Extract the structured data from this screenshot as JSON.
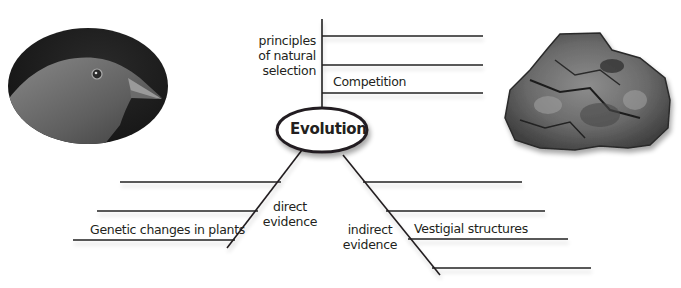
{
  "diagram": {
    "type": "concept-map",
    "center": {
      "label": "Evolution"
    },
    "branches": [
      {
        "id": "top",
        "label_lines": [
          "principles",
          "of natural",
          "selection"
        ],
        "lines": [
          {
            "text": ""
          },
          {
            "text": ""
          },
          {
            "text": "Competition"
          }
        ]
      },
      {
        "id": "left",
        "label_lines": [
          "direct",
          "evidence"
        ],
        "lines": [
          {
            "text": ""
          },
          {
            "text": ""
          },
          {
            "text": "Genetic changes in plants"
          }
        ]
      },
      {
        "id": "right",
        "label_lines": [
          "indirect",
          "evidence"
        ],
        "lines": [
          {
            "text": ""
          },
          {
            "text": ""
          },
          {
            "text": "Vestigial structures"
          },
          {
            "text": ""
          }
        ]
      }
    ]
  },
  "images": [
    {
      "name": "bird-head-photo",
      "description": "finch head, grayscale oval photo"
    },
    {
      "name": "fossil-rock-photo",
      "description": "fossil rock specimen"
    }
  ],
  "colors": {
    "line": "#231f20",
    "text": "#231f20",
    "background": "#ffffff"
  }
}
